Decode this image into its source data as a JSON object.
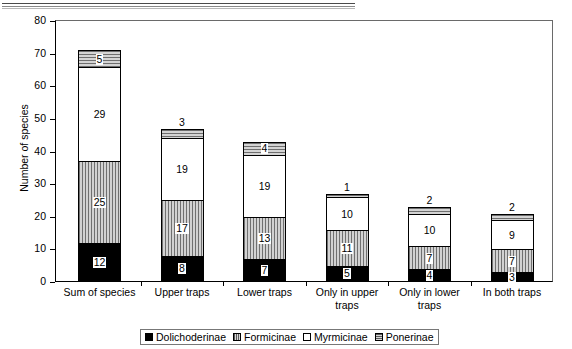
{
  "chart_data": {
    "type": "bar",
    "subtype": "stacked-column",
    "title": "",
    "xlabel": "",
    "ylabel": "Number of species",
    "ylim": [
      0,
      80
    ],
    "ytick_step": 10,
    "yticks": [
      0,
      10,
      20,
      30,
      40,
      50,
      60,
      70,
      80
    ],
    "grid": false,
    "legend_position": "bottom",
    "categories": [
      "Sum of species",
      "Upper traps",
      "Lower traps",
      "Only in upper traps",
      "Only in lower traps",
      "In both traps"
    ],
    "series": [
      {
        "name": "Dolichoderinae",
        "pattern": "solid-black",
        "color": "#000000",
        "values": [
          12,
          8,
          7,
          5,
          4,
          3
        ]
      },
      {
        "name": "Formicinae",
        "pattern": "vertical-hatch",
        "color": "#b5b5b5",
        "values": [
          25,
          17,
          13,
          11,
          7,
          7
        ]
      },
      {
        "name": "Myrmicinae",
        "pattern": "solid-white",
        "color": "#ffffff",
        "values": [
          29,
          19,
          19,
          10,
          10,
          9
        ]
      },
      {
        "name": "Ponerinae",
        "pattern": "horizontal-hatch",
        "color": "#b5b5b5",
        "values": [
          5,
          3,
          4,
          1,
          2,
          2
        ]
      }
    ],
    "totals": [
      71,
      47,
      43,
      27,
      23,
      21
    ],
    "value_label_placement": [
      [
        "inside",
        "inside",
        "inside",
        "inside"
      ],
      [
        "inside",
        "inside",
        "inside",
        "above"
      ],
      [
        "inside",
        "inside",
        "inside",
        "inside"
      ],
      [
        "inside",
        "inside",
        "inside",
        "above"
      ],
      [
        "inside",
        "inside",
        "inside",
        "above"
      ],
      [
        "inside",
        "inside",
        "inside",
        "above"
      ]
    ]
  },
  "legend": {
    "entries": [
      {
        "label": "Dolichoderinae"
      },
      {
        "label": "Formicinae"
      },
      {
        "label": "Myrmicinae"
      },
      {
        "label": "Ponerinae"
      }
    ]
  },
  "axes": {
    "y_title": "Number of species"
  }
}
